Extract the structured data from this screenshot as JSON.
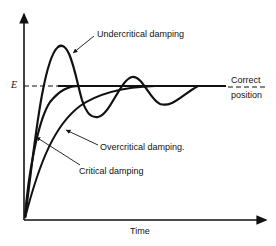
{
  "diagram": {
    "type": "damping-response-curves",
    "axes": {
      "x_label": "Time",
      "y_reference_label": "E",
      "reference_line_label": [
        "Correct",
        "position"
      ]
    },
    "curves": [
      {
        "name": "Undercritical damping",
        "label": "Undercritical damping"
      },
      {
        "name": "Critical damping",
        "label": "Critical damping"
      },
      {
        "name": "Overcritical damping",
        "label": "Overcritical damping."
      }
    ],
    "colors": {
      "line": "#111111",
      "background": "#ffffff"
    }
  }
}
